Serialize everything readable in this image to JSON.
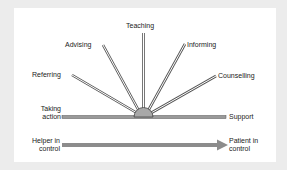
{
  "diagram": {
    "rays": [
      {
        "label": "Taking action"
      },
      {
        "label": "Referring"
      },
      {
        "label": "Advising"
      },
      {
        "label": "Teaching"
      },
      {
        "label": "Informing"
      },
      {
        "label": "Counselling"
      },
      {
        "label": "Support"
      }
    ],
    "left_end": {
      "line1": "Taking",
      "line2": "action"
    },
    "right_end": "Support",
    "labels": {
      "referring": "Referring",
      "advising": "Advising",
      "teaching": "Teaching",
      "informing": "Informing",
      "counselling": "Counselling"
    },
    "axis": {
      "left_line1": "Helper in",
      "left_line2": "control",
      "right_line1": "Patient in",
      "right_line2": "control"
    },
    "colors": {
      "ray_fill": "#9a9a9a",
      "ray_outline": "#555555",
      "hub_fill": "#a8a8a8",
      "arrow_fill": "#8c8c8c",
      "panel_bg": "#ffffff",
      "page_bg": "#ececec"
    }
  }
}
